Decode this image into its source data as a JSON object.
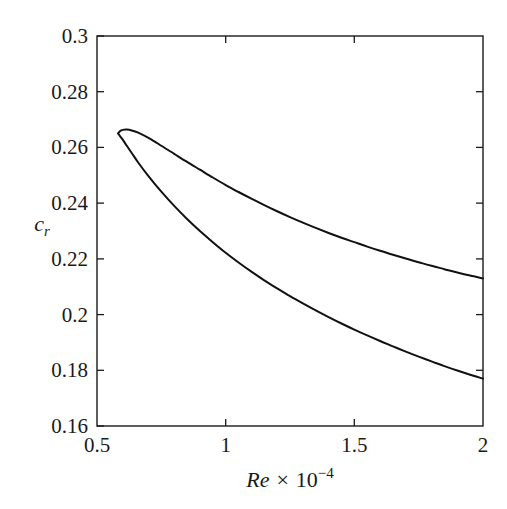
{
  "figure": {
    "background_color": "#ffffff",
    "foreground_color": "#1a1a1a",
    "curve_color": "#111111"
  },
  "chart_data": {
    "type": "line",
    "title": "",
    "subtitle": "",
    "xlabel": "Re × 10⁻⁴",
    "xlabel_parts": {
      "symbol": "Re",
      "times": "×",
      "base": "10",
      "exponent": "−4"
    },
    "ylabel": "c_r",
    "ylabel_parts": {
      "symbol": "c",
      "subscript": "r"
    },
    "xlim": [
      0.5,
      2.0
    ],
    "ylim": [
      0.16,
      0.3
    ],
    "xticks": [
      0.5,
      1.0,
      1.5,
      2.0
    ],
    "xtick_labels": [
      "0.5",
      "1",
      "1.5",
      "2"
    ],
    "yticks": [
      0.16,
      0.18,
      0.2,
      0.22,
      0.24,
      0.26,
      0.28,
      0.3
    ],
    "ytick_labels": [
      "0.16",
      "0.18",
      "0.2",
      "0.22",
      "0.24",
      "0.26",
      "0.28",
      "0.3"
    ],
    "grid": false,
    "legend": null,
    "legend_position": "none",
    "annotations": [],
    "series": [
      {
        "name": "upper branch",
        "x": [
          0.582,
          0.59,
          0.6,
          0.615,
          0.635,
          0.66,
          0.7,
          0.75,
          0.8,
          0.85,
          0.9,
          0.95,
          1.0,
          1.05,
          1.1,
          1.15,
          1.2,
          1.25,
          1.3,
          1.35,
          1.4,
          1.45,
          1.5,
          1.55,
          1.6,
          1.65,
          1.7,
          1.75,
          1.8,
          1.85,
          1.9,
          1.95,
          2.0
        ],
        "y": [
          0.265,
          0.2659,
          0.2663,
          0.2664,
          0.2661,
          0.2653,
          0.2634,
          0.2606,
          0.2577,
          0.2548,
          0.252,
          0.2492,
          0.2465,
          0.244,
          0.2416,
          0.2393,
          0.2371,
          0.235,
          0.233,
          0.2311,
          0.2293,
          0.2276,
          0.226,
          0.2244,
          0.2229,
          0.2215,
          0.2201,
          0.2188,
          0.2175,
          0.2163,
          0.2151,
          0.214,
          0.213
        ]
      },
      {
        "name": "lower branch",
        "x": [
          0.582,
          0.59,
          0.6,
          0.615,
          0.635,
          0.66,
          0.7,
          0.75,
          0.8,
          0.85,
          0.9,
          0.95,
          1.0,
          1.05,
          1.1,
          1.15,
          1.2,
          1.25,
          1.3,
          1.35,
          1.4,
          1.45,
          1.5,
          1.55,
          1.6,
          1.65,
          1.7,
          1.75,
          1.8,
          1.85,
          1.9,
          1.95,
          2.0
        ],
        "y": [
          0.265,
          0.264,
          0.2628,
          0.2607,
          0.258,
          0.2546,
          0.2497,
          0.2441,
          0.239,
          0.2343,
          0.23,
          0.226,
          0.2222,
          0.2187,
          0.2154,
          0.2123,
          0.2094,
          0.2066,
          0.204,
          0.2015,
          0.1991,
          0.1968,
          0.1946,
          0.1925,
          0.1905,
          0.1886,
          0.1867,
          0.1849,
          0.1832,
          0.1815,
          0.1799,
          0.1784,
          0.177
        ]
      }
    ]
  }
}
